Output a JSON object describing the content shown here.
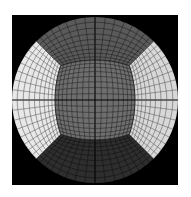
{
  "figure": {
    "background_color": "#000000",
    "canvas_color": "#ffffff",
    "frame": {
      "x": 12,
      "y": 15,
      "width": 166,
      "height": 170
    },
    "circle": {
      "cx": 95,
      "cy": 100,
      "r": 83
    },
    "grid_divisions_per_face": 16,
    "faces": {
      "front": {
        "label": "front",
        "fill": "#6e6e6e",
        "line": "#222222"
      },
      "top": {
        "label": "top",
        "fill": "#5a5a5a",
        "line": "#1e1e1e"
      },
      "bottom": {
        "label": "bottom",
        "fill": "#2e2e2e",
        "line": "#111111"
      },
      "left": {
        "label": "left",
        "fill": "#e8e8e8",
        "line": "#555555"
      },
      "right": {
        "label": "right",
        "fill": "#d8d8d8",
        "line": "#555555"
      }
    },
    "axis_line_color": "#000000"
  }
}
